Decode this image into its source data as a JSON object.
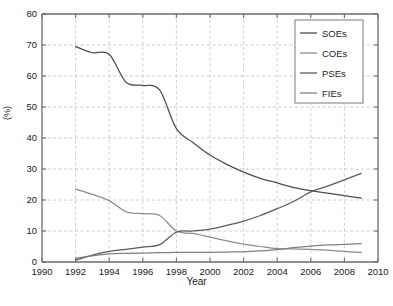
{
  "chart_data": {
    "type": "line",
    "title": "",
    "xlabel": "Year",
    "ylabel": "(%)",
    "xlim": [
      1990,
      2010
    ],
    "ylim": [
      0,
      80
    ],
    "xticks": [
      1990,
      1992,
      1994,
      1996,
      1998,
      2000,
      2002,
      2004,
      2006,
      2008,
      2010
    ],
    "yticks": [
      0,
      10,
      20,
      30,
      40,
      50,
      60,
      70,
      80
    ],
    "grid": true,
    "legend_position": "top-right",
    "x": [
      1992,
      1993,
      1994,
      1995,
      1996,
      1997,
      1998,
      1999,
      2000,
      2001,
      2002,
      2003,
      2004,
      2005,
      2006,
      2007,
      2008,
      2009
    ],
    "series": [
      {
        "name": "SOEs",
        "color": "#4d4d4d",
        "values": [
          69.5,
          67.5,
          67.0,
          58.0,
          57.0,
          55.5,
          43.0,
          38.5,
          34.5,
          31.5,
          29.0,
          27.0,
          25.5,
          24.0,
          23.0,
          22.2,
          21.4,
          20.6
        ]
      },
      {
        "name": "COEs",
        "color": "#8c8c8c",
        "values": [
          23.5,
          21.8,
          19.8,
          16.2,
          15.6,
          15.0,
          10.0,
          9.2,
          8.0,
          6.8,
          5.8,
          5.0,
          4.3,
          4.2,
          4.1,
          3.8,
          3.4,
          3.1
        ]
      },
      {
        "name": "PSEs",
        "color": "#5a5a5a",
        "values": [
          0.6,
          2.2,
          3.4,
          4.1,
          4.8,
          5.6,
          9.6,
          10.0,
          10.6,
          11.8,
          13.2,
          15.0,
          17.2,
          19.6,
          22.6,
          24.5,
          26.5,
          28.6
        ]
      },
      {
        "name": "FIEs",
        "color": "#808080",
        "values": [
          1.2,
          2.0,
          2.6,
          2.8,
          2.9,
          3.0,
          3.1,
          3.1,
          3.1,
          3.2,
          3.3,
          3.6,
          4.0,
          4.6,
          5.1,
          5.5,
          5.7,
          5.9
        ]
      }
    ],
    "notable_annotations": {
      "soe_pse_crossover_year": 2006,
      "soe_pse_crossover_value": 23,
      "coe_pse_crossover_year": 1998.5,
      "coe_pse_crossover_value": 10
    }
  },
  "legend": {
    "items": [
      {
        "label": "SOEs"
      },
      {
        "label": "COEs"
      },
      {
        "label": "PSEs"
      },
      {
        "label": "FIEs"
      }
    ]
  },
  "caption": {
    "text": ""
  },
  "colors": {
    "axis": "#6b6b6b",
    "grid": "#c2c2c2",
    "text": "#222222",
    "background": "#ffffff"
  }
}
